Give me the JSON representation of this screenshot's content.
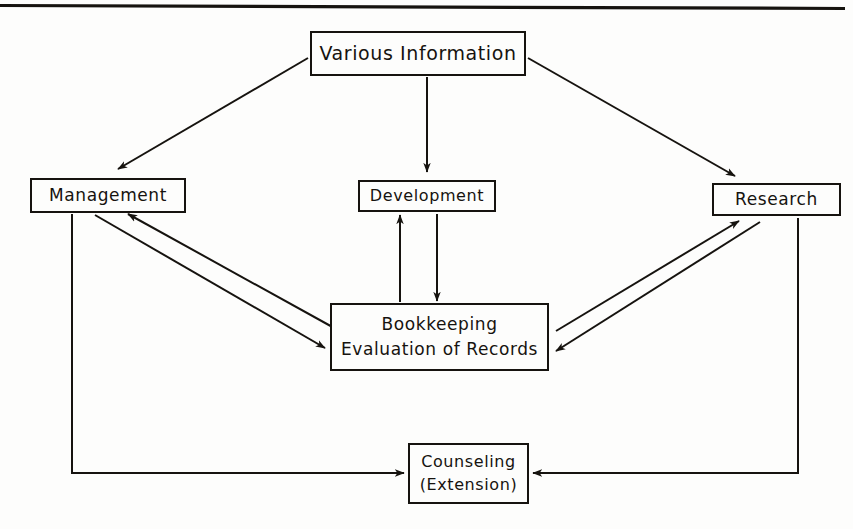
{
  "page": {
    "background_color": "#fdfdfc",
    "ink_color": "#16130f",
    "top_rule": "horizontal-rule"
  },
  "diagram": {
    "type": "flow-diagram",
    "nodes": [
      {
        "id": "various-information",
        "lines": [
          "Various Information"
        ],
        "x": 310,
        "y": 31,
        "w": 216,
        "h": 45
      },
      {
        "id": "management",
        "lines": [
          "Management"
        ],
        "x": 30,
        "y": 178,
        "w": 156,
        "h": 35
      },
      {
        "id": "development",
        "lines": [
          "Development"
        ],
        "x": 358,
        "y": 180,
        "w": 138,
        "h": 32
      },
      {
        "id": "research",
        "lines": [
          "Research"
        ],
        "x": 712,
        "y": 183,
        "w": 129,
        "h": 33
      },
      {
        "id": "bookkeeping",
        "lines": [
          "Bookkeeping",
          "Evaluation of Records"
        ],
        "x": 330,
        "y": 303,
        "w": 219,
        "h": 68
      },
      {
        "id": "counseling",
        "lines": [
          "Counseling",
          "(Extension)"
        ],
        "x": 408,
        "y": 443,
        "w": 121,
        "h": 61
      }
    ],
    "edges": [
      {
        "from": "various-information",
        "to": "management",
        "style": "diagonal",
        "direction": "one-way"
      },
      {
        "from": "various-information",
        "to": "development",
        "style": "vertical",
        "direction": "one-way"
      },
      {
        "from": "various-information",
        "to": "research",
        "style": "diagonal",
        "direction": "one-way"
      },
      {
        "from": "management",
        "to": "bookkeeping",
        "style": "diagonal-pair",
        "direction": "two-way"
      },
      {
        "from": "research",
        "to": "bookkeeping",
        "style": "diagonal-pair",
        "direction": "two-way"
      },
      {
        "from": "development",
        "to": "bookkeeping",
        "style": "vertical-pair",
        "direction": "two-way"
      },
      {
        "from": "management",
        "to": "counseling",
        "style": "orthogonal-left",
        "direction": "one-way"
      },
      {
        "from": "research",
        "to": "counseling",
        "style": "orthogonal-right",
        "direction": "one-way"
      }
    ]
  },
  "node_text": {
    "various_information": "Various Information",
    "management": "Management",
    "development": "Development",
    "research": "Research",
    "bookkeeping_line1": "Bookkeeping",
    "bookkeeping_line2": "Evaluation of Records",
    "counseling_line1": "Counseling",
    "counseling_line2": "(Extension)"
  }
}
